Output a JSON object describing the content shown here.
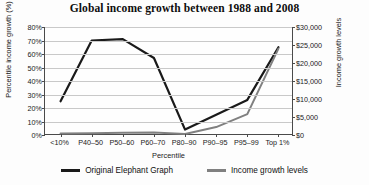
{
  "chart_data": {
    "type": "line",
    "title": "Global income growth between 1988 and 2008",
    "xlabel": "Percentile",
    "ylabel": "Percentile income growth (%)",
    "y2label": "Income growth levels",
    "categories": [
      "<10%",
      "P40–50",
      "P50–60",
      "P60–70",
      "P80–90",
      "P90–95",
      "P95–99",
      "Top 1%"
    ],
    "ylim": [
      0,
      80
    ],
    "y2lim": [
      0,
      30000
    ],
    "yticks": [
      "0%",
      "10%",
      "20%",
      "30%",
      "40%",
      "50%",
      "60%",
      "70%",
      "80%"
    ],
    "ytick_values": [
      0,
      10,
      20,
      30,
      40,
      50,
      60,
      70,
      80
    ],
    "y2ticks": [
      "$0",
      "$5,000",
      "$10,000",
      "$15,000",
      "$20,000",
      "$25,000",
      "$30,000"
    ],
    "y2tick_values": [
      0,
      5000,
      10000,
      15000,
      20000,
      25000,
      30000
    ],
    "grid": true,
    "legend_position": "bottom",
    "series": [
      {
        "name": "Original Elephant Graph",
        "axis": "left",
        "color": "#1a1a1a",
        "values": [
          25,
          70,
          71,
          57,
          4,
          15,
          26,
          65
        ]
      },
      {
        "name": "Income growth levels",
        "axis": "right",
        "color": "#808080",
        "values": [
          400,
          500,
          600,
          700,
          300,
          2200,
          5800,
          24000
        ]
      }
    ]
  },
  "legend": {
    "items": [
      {
        "label": "Original Elephant Graph",
        "color": "#1a1a1a"
      },
      {
        "label": "Income growth levels",
        "color": "#808080"
      }
    ]
  }
}
